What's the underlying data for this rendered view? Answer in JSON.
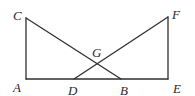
{
  "diagram": {
    "type": "geometry",
    "stroke_color": "#2f2f2f",
    "points": {
      "A": {
        "label": "A",
        "x": 26,
        "y": 79,
        "lx": 13,
        "ly": 92
      },
      "C": {
        "label": "C",
        "x": 26,
        "y": 18,
        "lx": 13,
        "ly": 20
      },
      "D": {
        "label": "D",
        "x": 74,
        "y": 79,
        "lx": 68,
        "ly": 95
      },
      "B": {
        "label": "B",
        "x": 121,
        "y": 79,
        "lx": 120,
        "ly": 95
      },
      "E": {
        "label": "E",
        "x": 168,
        "y": 79,
        "lx": 173,
        "ly": 93
      },
      "F": {
        "label": "F",
        "x": 168,
        "y": 17,
        "lx": 172,
        "ly": 19
      },
      "G": {
        "label": "G",
        "x": 97,
        "y": 62,
        "lx": 92,
        "ly": 57
      }
    },
    "segments": [
      {
        "from": "A",
        "to": "C"
      },
      {
        "from": "A",
        "to": "E"
      },
      {
        "from": "C",
        "to": "B"
      },
      {
        "from": "D",
        "to": "F"
      },
      {
        "from": "F",
        "to": "E"
      }
    ]
  }
}
